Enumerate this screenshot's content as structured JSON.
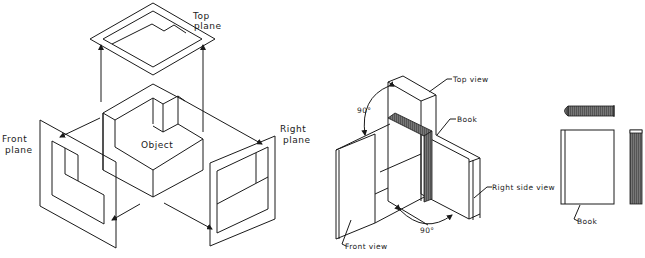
{
  "left_figure": {
    "top_plane_label_line1": "Top",
    "top_plane_label_line2": "plane",
    "front_plane_label_line1": "Front",
    "front_plane_label_line2": "plane",
    "right_plane_label_line1": "Right",
    "right_plane_label_line2": "plane",
    "object_label": "Object"
  },
  "right_figure": {
    "top_view_label": "Top view",
    "book_label": "Book",
    "right_side_view_label": "Right side view",
    "front_view_label": "Front view",
    "angle_upper": "90°",
    "angle_lower": "90°"
  },
  "orthographic_views": {
    "book_label": "Book"
  },
  "colors": {
    "line": "#1a1a1a",
    "background": "#ffffff",
    "spine_fill": "#555555"
  }
}
